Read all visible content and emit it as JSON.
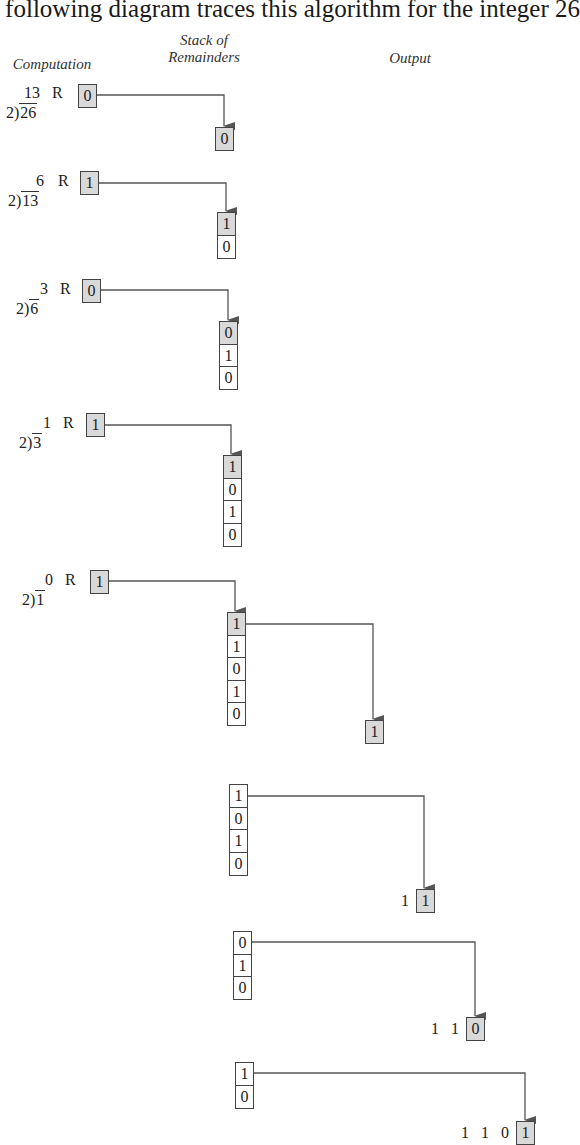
{
  "intro_text": "The following diagram traces this algorithm for the integer 26",
  "headers": {
    "computation": "Computation",
    "stack_line1": "Stack of",
    "stack_line2": "Remainders",
    "output": "Output"
  },
  "remainder_label": "R",
  "divisor": "2",
  "steps": [
    {
      "quotient": "13",
      "dividend": "26",
      "remainder": "0",
      "stack": [
        "0"
      ]
    },
    {
      "quotient": "6",
      "dividend": "13",
      "remainder": "1",
      "stack": [
        "1",
        "0"
      ]
    },
    {
      "quotient": "3",
      "dividend": "6",
      "remainder": "0",
      "stack": [
        "0",
        "1",
        "0"
      ]
    },
    {
      "quotient": "1",
      "dividend": "3",
      "remainder": "1",
      "stack": [
        "1",
        "0",
        "1",
        "0"
      ]
    },
    {
      "quotient": "0",
      "dividend": "1",
      "remainder": "1",
      "stack": [
        "1",
        "1",
        "0",
        "1",
        "0"
      ]
    }
  ],
  "pops": [
    {
      "stack": [
        "1",
        "1",
        "0",
        "1",
        "0"
      ],
      "output_prefix": "",
      "output_new": "1"
    },
    {
      "stack": [
        "1",
        "0",
        "1",
        "0"
      ],
      "output_prefix": "1",
      "output_new": "1"
    },
    {
      "stack": [
        "0",
        "1",
        "0"
      ],
      "output_prefix": "1 1",
      "output_new": "0"
    },
    {
      "stack": [
        "1",
        "0"
      ],
      "output_prefix": "1 1 0",
      "output_new": "1"
    }
  ],
  "colors": {
    "highlight_fill": "#d9d9d9",
    "line": "#555555",
    "box_border": "#444444"
  }
}
